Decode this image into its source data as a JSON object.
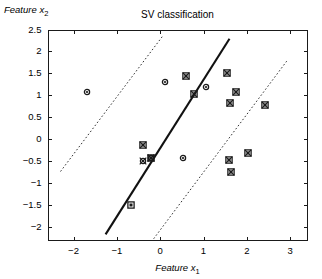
{
  "chart_data": {
    "type": "scatter",
    "title": "SV classification",
    "xlabel": "Feature x_1",
    "ylabel": "Feature x_2",
    "xlabel_base": "Feature x",
    "xlabel_sub": "1",
    "ylabel_base": "Feature x",
    "ylabel_sub": "2",
    "xlim": [
      -2.6,
      3.4
    ],
    "ylim": [
      -2.3,
      2.5
    ],
    "xticks": [
      -2,
      -1,
      0,
      1,
      2,
      3
    ],
    "xticklabels": [
      "-2",
      "-1",
      "0",
      "1",
      "2",
      "3"
    ],
    "yticks": [
      2.5,
      2,
      1.5,
      1,
      0.5,
      0,
      -0.5,
      -1,
      -1.5,
      -2
    ],
    "yticklabels": [
      "2.5",
      "2",
      "1.5",
      "1",
      "0.5",
      "0",
      "-0.5",
      "-1",
      "-1.5",
      "-2"
    ],
    "grid": false,
    "legend": null,
    "series": [
      {
        "name": "class-circle",
        "marker": "circle",
        "color": "#1a1a1a",
        "points": [
          {
            "x": -1.7,
            "y": 1.08,
            "sv": false
          },
          {
            "x": 0.11,
            "y": 1.3,
            "sv": false
          },
          {
            "x": 1.05,
            "y": 1.19,
            "sv": false
          },
          {
            "x": -0.21,
            "y": -0.42,
            "sv": true
          },
          {
            "x": -0.4,
            "y": -0.5,
            "sv": true
          },
          {
            "x": 0.53,
            "y": -0.43,
            "sv": false
          }
        ]
      },
      {
        "name": "class-square",
        "marker": "square",
        "color": "#1a1a1a",
        "points": [
          {
            "x": 0.6,
            "y": 1.44,
            "sv": true
          },
          {
            "x": 0.78,
            "y": 1.03,
            "sv": true
          },
          {
            "x": -0.4,
            "y": -0.13,
            "sv": true
          },
          {
            "x": -0.22,
            "y": -0.42,
            "sv": true
          },
          {
            "x": -0.67,
            "y": -1.5,
            "sv": false
          },
          {
            "x": 1.54,
            "y": 1.5,
            "sv": true
          },
          {
            "x": 1.74,
            "y": 1.07,
            "sv": true
          },
          {
            "x": 1.62,
            "y": 0.82,
            "sv": true
          },
          {
            "x": 2.42,
            "y": 0.79,
            "sv": true
          },
          {
            "x": 2.02,
            "y": -0.31,
            "sv": true
          },
          {
            "x": 1.59,
            "y": -0.48,
            "sv": true
          },
          {
            "x": 1.63,
            "y": -0.75,
            "sv": true
          }
        ]
      }
    ],
    "lines": [
      {
        "name": "decision-boundary",
        "style": "solid",
        "width": 2.1,
        "color": "#111111",
        "x0": -1.26,
        "y0": -2.16,
        "x1": 1.6,
        "y1": 2.29
      },
      {
        "name": "margin-upper-left",
        "style": "dotted",
        "width": 1.0,
        "color": "#333333",
        "x0": -2.3,
        "y0": -0.73,
        "x1": 0.05,
        "y1": 2.34
      },
      {
        "name": "margin-lower-right",
        "style": "dotted",
        "width": 1.0,
        "color": "#333333",
        "x0": -0.15,
        "y0": -2.26,
        "x1": 2.92,
        "y1": 1.78
      }
    ]
  }
}
